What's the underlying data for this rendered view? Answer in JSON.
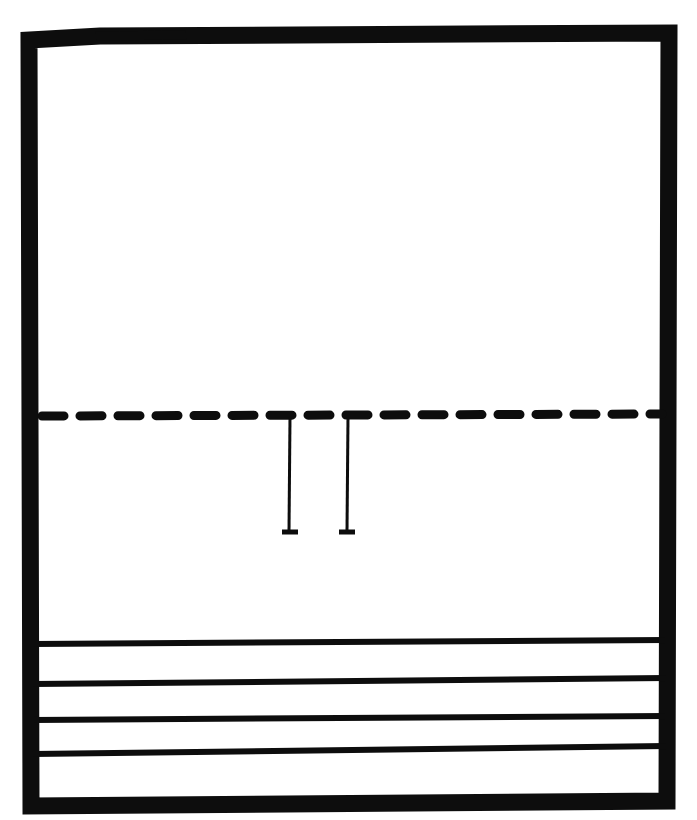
{
  "figure": {
    "background_color": "#ffffff",
    "ink_color": "#0d0d0d",
    "width": 697,
    "height": 820
  },
  "frame": {
    "name": "outer-border",
    "stroke_width": 17,
    "top_left": [
      29,
      32
    ],
    "top_right": [
      669,
      26
    ],
    "bottom_right": [
      667,
      800
    ],
    "bottom_left": [
      30,
      810
    ],
    "path": "M 29 40 L 31 806 L 667 801 L 669 33 L 100 36 L 29 40 Z"
  },
  "dashed_divider": {
    "name": "dashed-midline",
    "y": 416,
    "x_start": 38,
    "x_end": 664,
    "stroke_width": 9,
    "dash_length": 22,
    "gap_length": 16,
    "dash_count": 17
  },
  "tick_marks": [
    {
      "name": "tick-left",
      "x": 290,
      "y_top": 417,
      "y_bottom": 531,
      "foot_half_width": 8,
      "foot_y": 531
    },
    {
      "name": "tick-right",
      "x": 347,
      "y_top": 417,
      "y_bottom": 531,
      "foot_half_width": 8,
      "foot_y": 531
    }
  ],
  "rule_lines": [
    {
      "name": "rule-line-1",
      "y_left": 644,
      "y_right": 640,
      "x_start": 33,
      "x_end": 666
    },
    {
      "name": "rule-line-2",
      "y_left": 684,
      "y_right": 678,
      "x_start": 33,
      "x_end": 666
    },
    {
      "name": "rule-line-3",
      "y_left": 720,
      "y_right": 716,
      "x_start": 33,
      "x_end": 666
    },
    {
      "name": "rule-line-4",
      "y_left": 754,
      "y_right": 746,
      "x_start": 33,
      "x_end": 666
    }
  ],
  "chart_data": {
    "type": "line",
    "xlabel": "",
    "ylabel": "",
    "grid": false,
    "legend": "none",
    "xlim": [
      0,
      697
    ],
    "ylim": [
      0,
      820
    ],
    "annotations": [
      "Thick rectangular outer frame, slightly skewed, drawn in black ink",
      "Horizontal dashed line crossing the frame at roughly 50% height",
      "Two short vertical tick marks with small horizontal feet hanging below the dashed line",
      "Four horizontal ruled lines spanning the frame width in the lower quarter"
    ],
    "series": [
      {
        "name": "dashed-midline",
        "y": 416,
        "x": [
          38,
          664
        ],
        "style": "dashed"
      },
      {
        "name": "tick-left",
        "x": 290,
        "y": [
          417,
          531
        ],
        "style": "solid-vertical"
      },
      {
        "name": "tick-right",
        "x": 347,
        "y": [
          417,
          531
        ],
        "style": "solid-vertical"
      },
      {
        "name": "rule-line-1",
        "y": 642,
        "x": [
          33,
          666
        ],
        "style": "solid"
      },
      {
        "name": "rule-line-2",
        "y": 681,
        "x": [
          33,
          666
        ],
        "style": "solid"
      },
      {
        "name": "rule-line-3",
        "y": 718,
        "x": [
          33,
          666
        ],
        "style": "solid"
      },
      {
        "name": "rule-line-4",
        "y": 750,
        "x": [
          33,
          666
        ],
        "style": "solid"
      }
    ]
  }
}
